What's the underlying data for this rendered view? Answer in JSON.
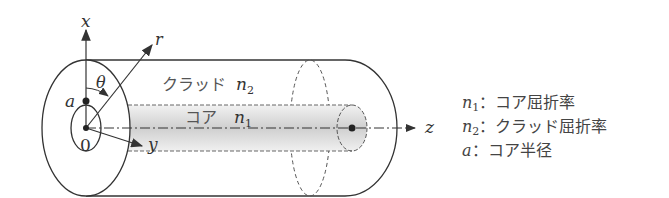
{
  "diagram": {
    "type": "optical-fiber-cylindrical-coordinates",
    "axes": {
      "x": "x",
      "y": "y",
      "z": "z",
      "r": "r",
      "theta": "θ",
      "origin": "0",
      "radius": "a"
    },
    "regions": {
      "cladding": {
        "label": "クラッド",
        "index_symbol": "n",
        "index_sub": "2"
      },
      "core": {
        "label": "コア",
        "index_symbol": "n",
        "index_sub": "1"
      }
    }
  },
  "legend": [
    {
      "symbol": "n",
      "sub": "1",
      "sep": "：",
      "text": "コア屈折率"
    },
    {
      "symbol": "n",
      "sub": "2",
      "sep": "：",
      "text": "クラッド屈折率"
    },
    {
      "symbol": "a",
      "sub": "",
      "sep": "：",
      "text": "コア半径"
    }
  ],
  "colors": {
    "line": "#333333",
    "core_fill": "#d9d9d9",
    "text": "#444444"
  }
}
